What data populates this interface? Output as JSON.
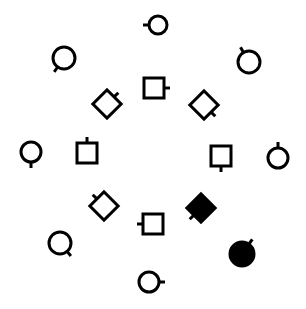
{
  "diagram": {
    "width": 306,
    "height": 309,
    "background": "#ffffff",
    "stroke_color": "#000000",
    "stroke_width": 3,
    "shapes": [
      {
        "type": "circle",
        "cx": 158,
        "cy": 25,
        "size": 9,
        "filled": false,
        "stick_angle": 180
      },
      {
        "type": "circle",
        "cx": 64,
        "cy": 58,
        "size": 11,
        "filled": false,
        "stick_angle": 125
      },
      {
        "type": "circle",
        "cx": 249,
        "cy": 62,
        "size": 11,
        "filled": false,
        "stick_angle": -120
      },
      {
        "type": "square",
        "cx": 154,
        "cy": 88,
        "size": 20,
        "filled": false,
        "stick_angle": 0
      },
      {
        "type": "diamond",
        "cx": 107,
        "cy": 104,
        "size": 20,
        "filled": false,
        "stick_angle": -45
      },
      {
        "type": "diamond",
        "cx": 204,
        "cy": 105,
        "size": 20,
        "filled": false,
        "stick_angle": 45
      },
      {
        "type": "circle",
        "cx": 31,
        "cy": 152,
        "size": 10,
        "filled": false,
        "stick_angle": 90
      },
      {
        "type": "square",
        "cx": 87,
        "cy": 153,
        "size": 20,
        "filled": false,
        "stick_angle": -90
      },
      {
        "type": "square",
        "cx": 221,
        "cy": 156,
        "size": 20,
        "filled": false,
        "stick_angle": 90
      },
      {
        "type": "circle",
        "cx": 278,
        "cy": 158,
        "size": 10,
        "filled": false,
        "stick_angle": -90
      },
      {
        "type": "diamond",
        "cx": 104,
        "cy": 206,
        "size": 20,
        "filled": false,
        "stick_angle": -135
      },
      {
        "type": "diamond",
        "cx": 201,
        "cy": 208,
        "size": 20,
        "filled": true,
        "stick_angle": 135
      },
      {
        "type": "square",
        "cx": 153,
        "cy": 224,
        "size": 20,
        "filled": false,
        "stick_angle": 180
      },
      {
        "type": "circle",
        "cx": 60,
        "cy": 243,
        "size": 11,
        "filled": false,
        "stick_angle": 50
      },
      {
        "type": "circle",
        "cx": 242,
        "cy": 254,
        "size": 12,
        "filled": true,
        "stick_angle": -55
      },
      {
        "type": "circle",
        "cx": 149,
        "cy": 282,
        "size": 10,
        "filled": false,
        "stick_angle": 0
      }
    ]
  }
}
